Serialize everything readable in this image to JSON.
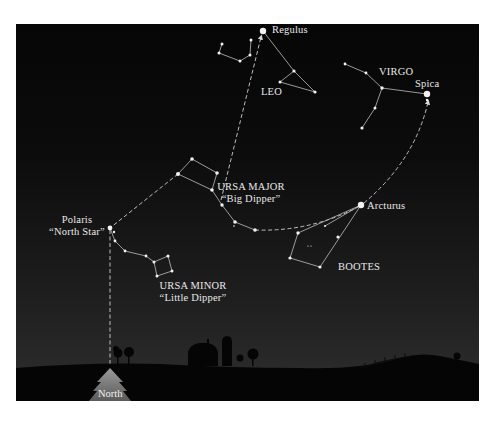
{
  "figure": {
    "colors": {
      "sky_top": "#060606",
      "sky_bottom": "#2f2f2f",
      "star": "#f2f2f2",
      "line": "#cfcfcf",
      "ground": "#050505",
      "arrow": "#8a8a8a"
    }
  },
  "labels": {
    "regulus": "Regulus",
    "leo": "LEO",
    "virgo": "VIRGO",
    "spica": "Spica",
    "ursa_major": "URSA MAJOR",
    "ursa_major_nick": "“Big Dipper”",
    "polaris": "Polaris",
    "polaris_nick": "“North Star”",
    "arcturus": "Arcturus",
    "bootes": "BOOTES",
    "ursa_minor": "URSA MINOR",
    "ursa_minor_nick": "“Little Dipper”",
    "north": "North"
  },
  "constellations": [
    {
      "name": "Leo",
      "bright_star": "Regulus"
    },
    {
      "name": "Virgo",
      "bright_star": "Spica"
    },
    {
      "name": "Ursa Major",
      "nickname": "Big Dipper"
    },
    {
      "name": "Bootes",
      "bright_star": "Arcturus"
    },
    {
      "name": "Ursa Minor",
      "nickname": "Little Dipper",
      "bright_star": "Polaris"
    }
  ],
  "pointer_lines": [
    {
      "from": "Big Dipper bowl",
      "to": "Regulus",
      "style": "dashed arrow"
    },
    {
      "from": "Big Dipper handle",
      "to": "Arcturus",
      "style": "dashed arc"
    },
    {
      "from": "Arcturus",
      "to": "Spica",
      "style": "dashed arc arrow"
    },
    {
      "from": "Big Dipper bowl",
      "to": "Polaris",
      "style": "dashed"
    },
    {
      "from": "Polaris",
      "to": "North horizon",
      "style": "dashed vertical"
    }
  ]
}
